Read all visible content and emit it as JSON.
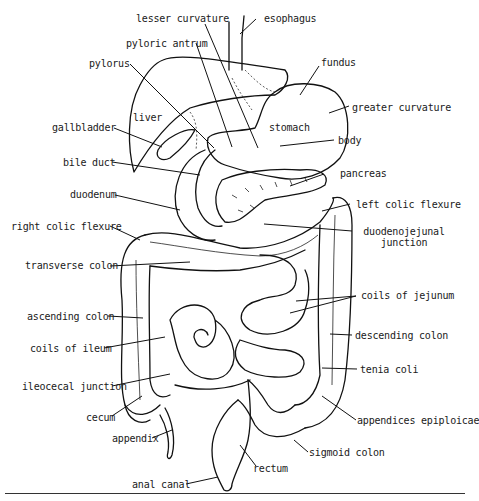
{
  "diagram": {
    "labels": {
      "lesser_curvature": "lesser curvature",
      "esophagus": "esophagus",
      "pyloric_antrum": "pyloric antrum",
      "pylorus": "pylorus",
      "fundus": "fundus",
      "liver": "liver",
      "stomach": "stomach",
      "greater_curvature": "greater curvature",
      "gallbladder": "gallbladder",
      "body": "body",
      "bile_duct": "bile duct",
      "pancreas": "pancreas",
      "duodenum": "duodenum",
      "left_colic_flexure": "left colic flexure",
      "right_colic_flexure": "right colic flexure",
      "duodenojejunal_junction_line1": "duodenojejunal",
      "duodenojejunal_junction_line2": "junction",
      "transverse_colon": "transverse colon",
      "coils_of_jejunum": "coils of jejunum",
      "ascending_colon": "ascending colon",
      "descending_colon": "descending colon",
      "coils_of_ileum": "coils of ileum",
      "tenia_coli": "tenia coli",
      "ileocecal_junction": "ileocecal junction",
      "cecum": "cecum",
      "appendices_epiploicae": "appendices epiploicae",
      "appendix": "appendix",
      "sigmoid_colon": "sigmoid colon",
      "rectum": "rectum",
      "anal_canal": "anal canal"
    }
  }
}
